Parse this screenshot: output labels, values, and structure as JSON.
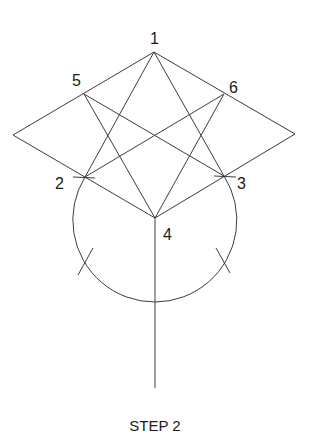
{
  "diagram": {
    "title": "STEP 2",
    "stroke_color": "#3c3c3c",
    "points": {
      "1": {
        "label": "1",
        "x": 154,
        "y": 52
      },
      "2": {
        "label": "2",
        "x": 85,
        "y": 177
      },
      "3": {
        "label": "3",
        "x": 224,
        "y": 176
      },
      "4": {
        "label": "4",
        "x": 155,
        "y": 218
      },
      "5": {
        "label": "5",
        "x": 84,
        "y": 94
      },
      "6": {
        "label": "6",
        "x": 224,
        "y": 94
      },
      "left_vertex": {
        "x": 13,
        "y": 135
      },
      "right_vertex": {
        "x": 295,
        "y": 134
      }
    },
    "labels": [
      {
        "id": "label-1",
        "text": "1"
      },
      {
        "id": "label-2",
        "text": "2"
      },
      {
        "id": "label-3",
        "text": "3"
      },
      {
        "id": "label-4",
        "text": "4"
      },
      {
        "id": "label-5",
        "text": "5"
      },
      {
        "id": "label-6",
        "text": "6"
      }
    ],
    "circle": {
      "cx": 154,
      "cy": 220,
      "r": 82
    },
    "stem_end_y": 388
  }
}
